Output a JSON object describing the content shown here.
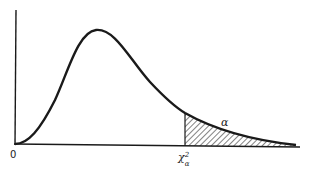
{
  "figure": {
    "origin_label": "0",
    "critical_label": "χ",
    "critical_sup": "2",
    "critical_sub": "α",
    "area_label": "α",
    "colors": {
      "ink": "#1a1a1a",
      "background": "#ffffff"
    }
  }
}
